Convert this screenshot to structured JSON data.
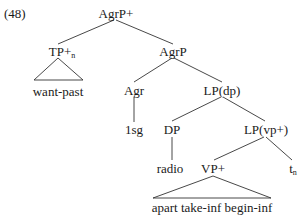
{
  "example_number": "(48)",
  "nodes": {
    "root": {
      "label": "AgrP+"
    },
    "tp": {
      "label": "TP+",
      "subscript": "n"
    },
    "tp_leaf": {
      "label": "want-past"
    },
    "agrp": {
      "label": "AgrP"
    },
    "agr": {
      "label": "Agr"
    },
    "agr_leaf": {
      "label": "1sg"
    },
    "lp_dp": {
      "label": "LP(dp)"
    },
    "dp": {
      "label": "DP"
    },
    "dp_leaf": {
      "label": "radio"
    },
    "lp_vp": {
      "label": "LP(vp+)"
    },
    "vp": {
      "label": "VP+"
    },
    "vp_leaf": {
      "label": "apart take-inf begin-inf"
    },
    "trace": {
      "label": "t",
      "subscript": "n"
    }
  }
}
